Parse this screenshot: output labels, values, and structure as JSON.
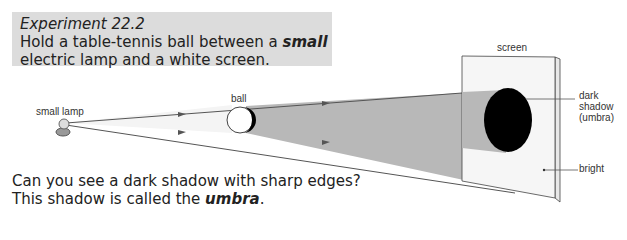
{
  "experiment": {
    "title": "Experiment 22.2",
    "instruction_pre": "Hold a table-tennis ball between a ",
    "instruction_em": "small",
    "instruction_post": " electric lamp and a white screen."
  },
  "question": {
    "line1": "Can you see a dark shadow with sharp edges?",
    "line2_pre": "This shadow is called the ",
    "line2_em": "umbra",
    "line2_post": "."
  },
  "labels": {
    "lamp": "small lamp",
    "ball": "ball",
    "screen": "screen",
    "shadow1": "dark",
    "shadow2": "shadow",
    "shadow3": "(umbra)",
    "bright": "bright"
  },
  "colors": {
    "box_bg": "#dcdcdc",
    "shadow_cone": "#b8b8b8",
    "umbra": "#000000"
  }
}
